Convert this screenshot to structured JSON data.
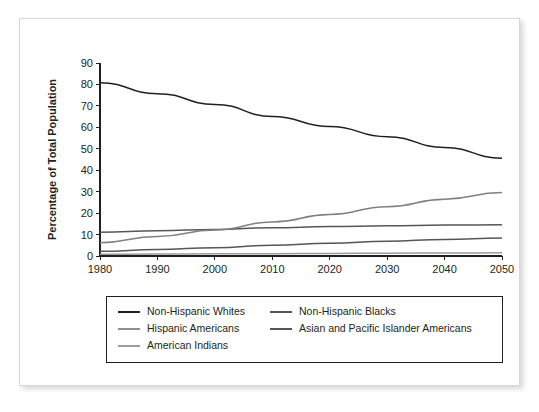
{
  "watermark": "",
  "chart_data": {
    "type": "line",
    "title": "",
    "xlabel": "",
    "ylabel": "Percentage of Total Population",
    "x": [
      1980,
      1990,
      2000,
      2010,
      2020,
      2030,
      2040,
      2050
    ],
    "xlim": [
      1980,
      2050
    ],
    "ylim": [
      0,
      90
    ],
    "xticks": [
      "1980",
      "1990",
      "2000",
      "2010",
      "2020",
      "2030",
      "2040",
      "2050"
    ],
    "yticks": [
      "0",
      "10",
      "20",
      "30",
      "40",
      "50",
      "60",
      "70",
      "80",
      "90"
    ],
    "grid": false,
    "legend_position": "below-plot",
    "series": [
      {
        "name": "Non-Hispanic Whites",
        "color": "#231f20",
        "values": [
          80.8,
          75.7,
          70.7,
          65.1,
          60.4,
          55.6,
          50.6,
          45.6
        ]
      },
      {
        "name": "Non-Hispanic  Blacks",
        "color": "#55565a",
        "values": [
          11.1,
          11.8,
          12.4,
          13.2,
          13.7,
          14.1,
          14.4,
          14.6
        ]
      },
      {
        "name": "Hispanic Americans",
        "color": "#7e8083",
        "values": [
          6.2,
          9.1,
          12.1,
          15.9,
          19.4,
          23.0,
          26.5,
          29.6
        ]
      },
      {
        "name": "Asian and Pacific Islander Americans",
        "color": "#55565a",
        "values": [
          2.2,
          3.0,
          3.9,
          5.0,
          6.0,
          6.9,
          7.7,
          8.4
        ]
      },
      {
        "name": "American Indians",
        "color": "#9a9b9e",
        "values": [
          0.8,
          0.9,
          1.0,
          1.1,
          1.2,
          1.3,
          1.4,
          1.5
        ]
      }
    ]
  },
  "legend": {
    "entries": [
      {
        "label": "Non-Hispanic Whites",
        "color": "#231f20"
      },
      {
        "label": "Non-Hispanic  Blacks",
        "color": "#55565a"
      },
      {
        "label": "Hispanic Americans",
        "color": "#8e9093"
      },
      {
        "label": "Asian and Pacific Islander Americans",
        "color": "#55565a"
      },
      {
        "label": "American Indians",
        "color": "#9a9b9e"
      }
    ]
  }
}
